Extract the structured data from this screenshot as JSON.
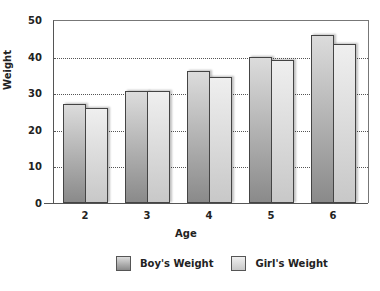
{
  "chart_data": {
    "type": "bar",
    "title": "",
    "xlabel": "Age",
    "ylabel": "Weight",
    "categories": [
      "2",
      "3",
      "4",
      "5",
      "6"
    ],
    "series": [
      {
        "name": "Boy's Weight",
        "values": [
          27,
          30.5,
          36,
          40,
          46
        ],
        "color": "#9a9a9a"
      },
      {
        "name": "Girl's Weight",
        "values": [
          26,
          30.5,
          34.5,
          39,
          43.5
        ],
        "color": "#d8d8d8"
      }
    ],
    "ylim": [
      0,
      50
    ],
    "yticks": [
      "0",
      "10",
      "20",
      "30",
      "40",
      "50"
    ],
    "grid": true,
    "legend_position": "bottom"
  },
  "axis": {
    "x_title": "Age",
    "y_title": "Weight"
  },
  "legend": {
    "boy": "Boy's Weight",
    "girl": "Girl's Weight"
  }
}
